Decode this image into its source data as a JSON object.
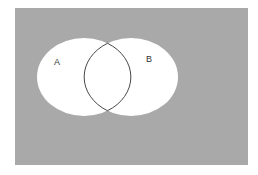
{
  "diagram": {
    "type": "venn",
    "universe": {
      "x": 15,
      "y": 8,
      "width": 233,
      "height": 157,
      "fill": "#a9a9a9"
    },
    "sets": [
      {
        "label": "A",
        "cx": 84,
        "cy": 77,
        "rx": 47,
        "ry": 39,
        "fill": "#ffffff"
      },
      {
        "label": "B",
        "cx": 131,
        "cy": 77,
        "rx": 47,
        "ry": 39,
        "fill": "#ffffff"
      }
    ],
    "outline_color": "#333333"
  }
}
